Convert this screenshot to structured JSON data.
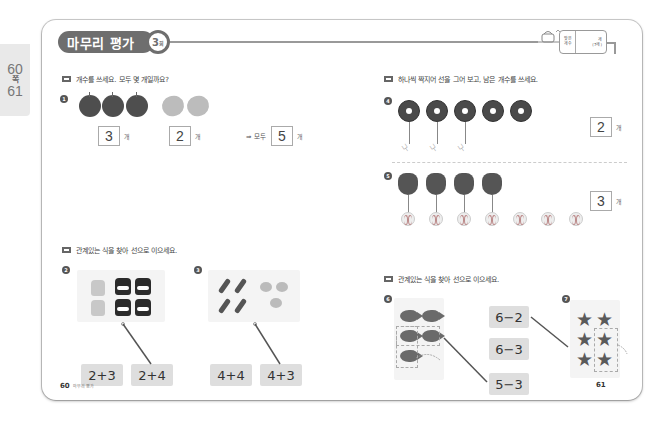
{
  "side_tab": {
    "page1": "60",
    "unit1": "쪽",
    "separator": "·",
    "page2": "61",
    "unit2": "쪽"
  },
  "header": {
    "title": "마무리 평가",
    "round_number": "3",
    "round_suffix": "회",
    "score_box": {
      "label_line1": "맞은",
      "label_line2": "개수",
      "value_unit": "개",
      "total": "(7개)"
    }
  },
  "left_page": {
    "section1": {
      "instruction": "개수를 쓰세요. 모두 몇 개일까요?",
      "question": {
        "number": "1",
        "apples_count": 3,
        "lemons_count": 2,
        "answer_apples": "3",
        "answer_lemons": "2",
        "total_label": "⇒ 모두",
        "answer_total": "5",
        "unit": "개"
      }
    },
    "section2": {
      "instruction": "관계있는 식을 찾아 선으로 이으세요.",
      "questions": [
        {
          "number": "2",
          "picture": "2 light jars + 4 dark jars",
          "options": [
            "2+3",
            "2+4"
          ],
          "connected": "2+4"
        },
        {
          "number": "3",
          "picture": "4 sausages + 3 candies",
          "options": [
            "4+4",
            "4+3"
          ],
          "connected": "4+3"
        }
      ]
    },
    "footer": {
      "page_number": "60",
      "label": "마무리 평가"
    }
  },
  "right_page": {
    "section1": {
      "instruction": "하나씩 짝지어 선을 그어 보고, 남은 개수를 쓰세요.",
      "questions": [
        {
          "number": "4",
          "top_items": "donuts",
          "top_count": 5,
          "bottom_items": "forks",
          "bottom_count": 3,
          "answer": "2",
          "unit": "개"
        },
        {
          "number": "5",
          "top_items": "gloves",
          "top_count": 4,
          "bottom_items": "baseballs",
          "bottom_count": 7,
          "answer": "3",
          "unit": "개"
        }
      ]
    },
    "section2": {
      "instruction": "관계있는 식을 찾아 선으로 이으세요.",
      "options": [
        "6−2",
        "6−3",
        "5−3"
      ],
      "questions": [
        {
          "number": "6",
          "picture": "5 fish, 3 boxed and removed",
          "connected": "5−3"
        },
        {
          "number": "7",
          "picture": "6 stars, 2 boxed and removed",
          "connected": "6−2"
        }
      ]
    },
    "footer": {
      "page_number": "61"
    }
  },
  "colors": {
    "badge": "#6e6e6e",
    "expression_box": "#dedede",
    "side_tab": "#e9e9e9"
  }
}
